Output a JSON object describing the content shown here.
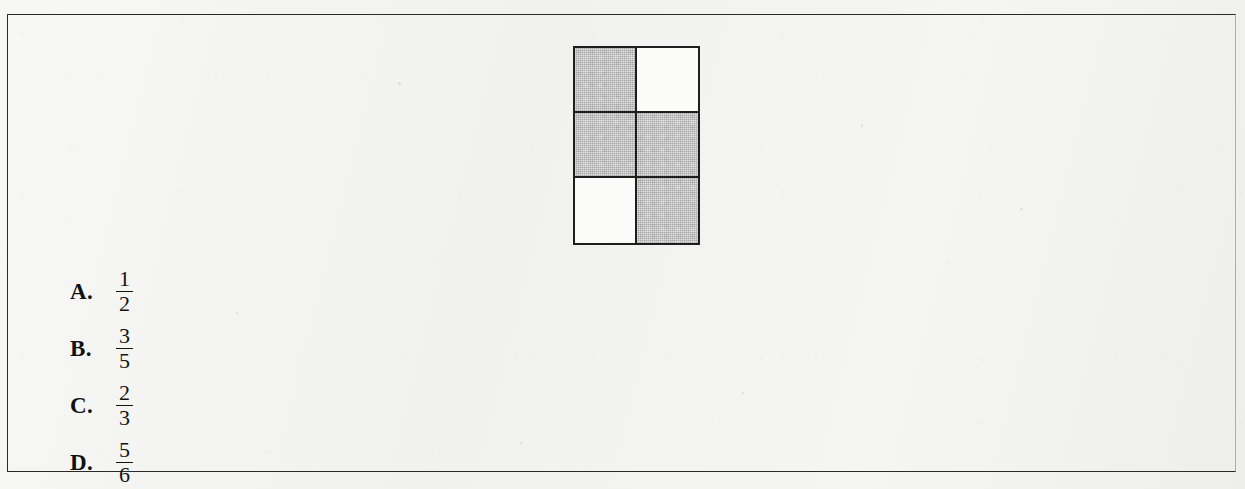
{
  "figure": {
    "name": "shaded-fraction-grid",
    "columns": 2,
    "rows": 3,
    "total_cells": 6,
    "shaded_count": 4,
    "unshaded_count": 2,
    "shaded_fraction": "4/6",
    "cells": [
      {
        "row": 1,
        "col": 1,
        "state": "shaded"
      },
      {
        "row": 1,
        "col": 2,
        "state": "unshaded"
      },
      {
        "row": 2,
        "col": 1,
        "state": "shaded"
      },
      {
        "row": 2,
        "col": 2,
        "state": "shaded"
      },
      {
        "row": 3,
        "col": 1,
        "state": "unshaded"
      },
      {
        "row": 3,
        "col": 2,
        "state": "shaded"
      }
    ],
    "colors": {
      "shaded": "#a6a6a6",
      "unshaded": "#fbfbfa",
      "border": "#1e1e1e"
    }
  },
  "options": [
    {
      "letter": "A.",
      "numerator": "1",
      "denominator": "2"
    },
    {
      "letter": "B.",
      "numerator": "3",
      "denominator": "5"
    },
    {
      "letter": "C.",
      "numerator": "2",
      "denominator": "3"
    },
    {
      "letter": "D.",
      "numerator": "5",
      "denominator": "6"
    }
  ],
  "page": {
    "background_color": "#f4f4f3",
    "frame_color": "#2a2a2a"
  }
}
